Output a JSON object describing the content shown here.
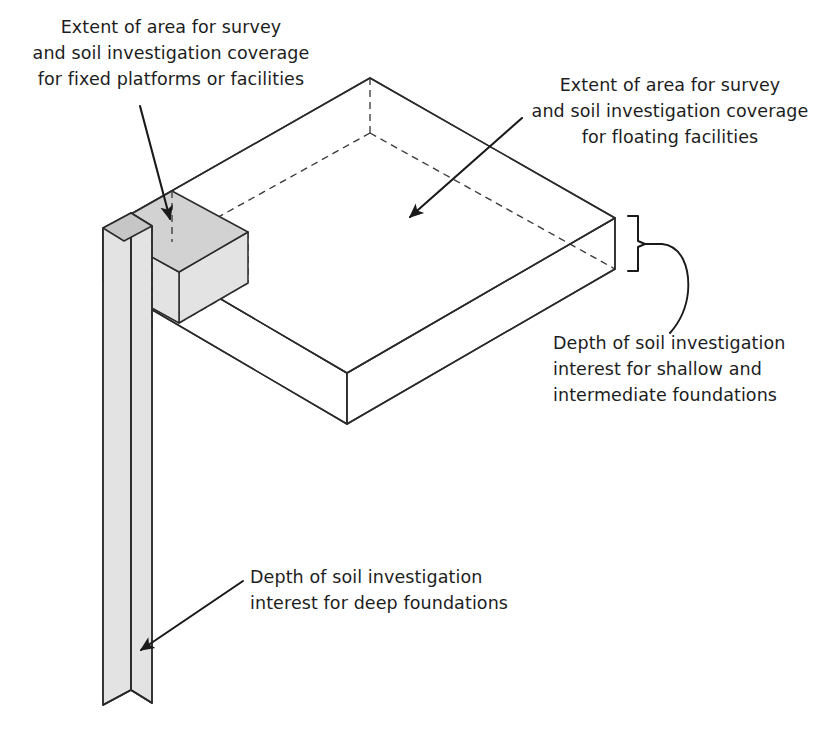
{
  "figure": {
    "type": "isometric-engineering-diagram",
    "background_color": "#ffffff",
    "line_color": "#2b2b2b",
    "shaded_fill_color": "#e3e3e3"
  },
  "labels": {
    "fixed_platforms": "Extent of area for survey\nand soil investigation coverage\nfor fixed platforms or facilities",
    "floating_facilities": "Extent of area for survey\nand soil investigation coverage\nfor floating facilities",
    "shallow_depth": "Depth of soil investigation\ninterest for shallow and\nintermediate foundations",
    "deep_depth": "Depth of soil investigation\ninterest for deep foundations"
  },
  "annotations": {
    "arrow_fixed_platforms": "arrow pointing down to small shaded box top face",
    "arrow_floating_facilities": "arrow pointing down-left to large slab top face",
    "arrow_deep_depth": "arrow pointing down-left to tall vertical column",
    "brace_shallow_depth": "curly brace spanning slab thickness on right corner"
  },
  "geometry": {
    "large_slab": {
      "name": "survey-coverage-slab-floating",
      "top_face": [
        [
          103,
          230
        ],
        [
          370,
          78
        ],
        [
          615,
          218
        ],
        [
          347,
          373
        ]
      ],
      "thickness_px": 51
    },
    "small_box": {
      "name": "survey-coverage-box-fixed",
      "top_face": [
        [
          103,
          230
        ],
        [
          172,
          191
        ],
        [
          248,
          232
        ],
        [
          179,
          272
        ]
      ],
      "thickness_px": 51
    },
    "column": {
      "name": "deep-foundation-column",
      "top_y": 213,
      "bottom_y": 705,
      "left_x": 103,
      "front_x": 131,
      "right_x": 152
    }
  }
}
